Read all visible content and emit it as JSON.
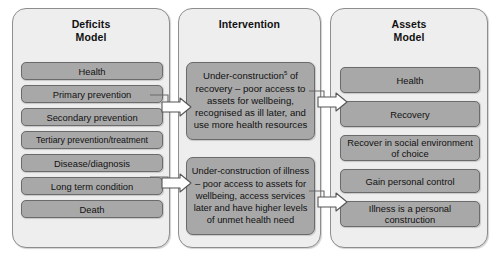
{
  "figure": {
    "type": "flow-diagram"
  },
  "panels": {
    "deficits": {
      "title_line1": "Deficits",
      "title_line2": "Model",
      "boxes": [
        "Health",
        "Primary prevention",
        "Secondary prevention",
        "Tertiary prevention/treatment",
        "Disease/diagnosis",
        "Long term condition",
        "Death"
      ]
    },
    "intervention": {
      "title_line1": "Intervention",
      "title_line2": "",
      "boxes": [
        {
          "text_before_sup": "Under-construction",
          "sup": "5",
          "text_after_sup": " of recovery – poor access to assets for wellbeing, recognised as ill later, and use more health resources"
        },
        {
          "text_before_sup": "Under-construction of illness – poor access to assets for wellbeing, access services later and have higher levels of unmet health need",
          "sup": "",
          "text_after_sup": ""
        }
      ]
    },
    "assets": {
      "title_line1": "Assets",
      "title_line2": "Model",
      "boxes": [
        "Health",
        "Recovery",
        "Recover in social environment of choice",
        "Gain personal control",
        "Illness is a personal construction"
      ]
    }
  },
  "connectors": [
    {
      "name": "secondary-prevention-to-under-construction-recovery",
      "from": "Secondary prevention",
      "to": "Under-construction of recovery"
    },
    {
      "name": "long-term-condition-to-under-construction-illness",
      "from": "Long term condition",
      "to": "Under-construction of illness"
    },
    {
      "name": "under-construction-recovery-to-recovery",
      "from": "Under-construction of recovery",
      "to": "Recovery"
    },
    {
      "name": "under-construction-illness-to-illness-is-a-personal-construction",
      "from": "Under-construction of illness",
      "to": "Illness is a personal construction"
    }
  ],
  "colors": {
    "panel_fill": "#eeeeee",
    "panel_stroke": "#8d8d8d",
    "box_fill": "#a8a8a8",
    "box_stroke": "#6b6b6b",
    "text": "#111111",
    "arrow_fill": "#ffffff",
    "arrow_stroke": "#555555",
    "background": "#ffffff"
  }
}
